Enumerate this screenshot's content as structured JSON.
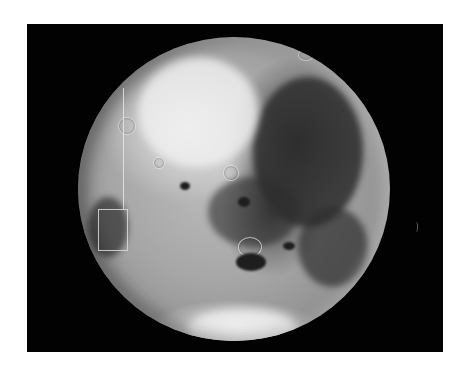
{
  "image": {
    "subject": "planetary-moon-photograph",
    "background_color": "#ffffff",
    "frame_color": "#020202",
    "planet": {
      "center": [
        234,
        189
      ],
      "radius_x": 156,
      "radius_y": 152,
      "base_tone": "#a6a6a6",
      "dark_region_tone": "#2e2e2e",
      "bright_region_tone": "#f0f0f0"
    },
    "annotations": {
      "vertical_line": {
        "x": 123,
        "y_start": 88,
        "y_end": 209,
        "color": "#e6e6e6"
      },
      "highlight_box": {
        "x": 98,
        "y": 209,
        "width": 28,
        "height": 40,
        "color": "#dcdcdc"
      }
    }
  }
}
